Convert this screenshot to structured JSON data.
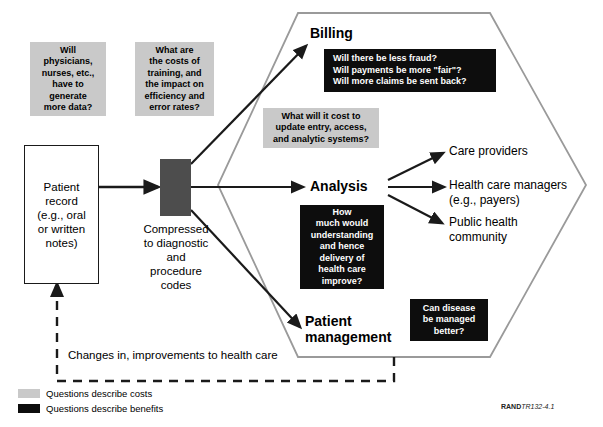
{
  "diagram": {
    "colors": {
      "cost_box_fill": "#c9c9c9",
      "benefit_box_fill": "#0d0d0d",
      "benefit_box_text": "#ffffff",
      "hexagon_stroke": "#9a9a9a",
      "arrow_stroke": "#1a1a1a",
      "compressed_fill": "#4d4d4d",
      "background": "#ffffff"
    }
  },
  "cost_questions": [
    {
      "id": "generate-more-data",
      "lines": [
        "Will",
        "physicians,",
        "nurses, etc.,",
        "have to",
        "generate",
        "more data?"
      ]
    },
    {
      "id": "training-costs",
      "lines": [
        "What are",
        "the costs of",
        "training, and",
        "the impact on",
        "efficiency and",
        "error rates?"
      ]
    },
    {
      "id": "system-update-costs",
      "lines": [
        "What will it cost to",
        "update entry, access,",
        "and analytic systems?"
      ]
    }
  ],
  "benefit_questions": [
    {
      "id": "billing-benefits",
      "lines": [
        "Will there be less fraud?",
        "Will payments be more \"fair\"?",
        "Will more claims be sent back?"
      ]
    },
    {
      "id": "analysis-benefits",
      "lines": [
        "How",
        "much would",
        "understanding",
        "and hence",
        "delivery of",
        "health care",
        "improve?"
      ]
    },
    {
      "id": "patient-management-benefits",
      "lines": [
        "Can disease",
        "be managed",
        "better?"
      ]
    }
  ],
  "input_node": {
    "id": "patient-record",
    "lines": [
      "Patient",
      "record",
      "(e.g., oral",
      "or written",
      "notes)"
    ]
  },
  "transform_node": {
    "id": "compressed-codes",
    "caption_lines": [
      "Compressed",
      "to diagnostic",
      "and",
      "procedure",
      "codes"
    ]
  },
  "stages": [
    {
      "id": "billing",
      "lines": [
        "Billing"
      ]
    },
    {
      "id": "analysis",
      "lines": [
        "Analysis"
      ]
    },
    {
      "id": "patient-management",
      "lines": [
        "Patient",
        "management"
      ]
    }
  ],
  "outcomes": [
    {
      "id": "care-providers",
      "lines": [
        "Care providers"
      ]
    },
    {
      "id": "health-care-managers",
      "lines": [
        "Health care managers",
        "(e.g., payers)"
      ]
    },
    {
      "id": "public-health-community",
      "lines": [
        "Public health",
        "community"
      ]
    }
  ],
  "feedback": {
    "id": "feedback-loop",
    "label": "Changes in, improvements to health care"
  },
  "legend": [
    {
      "id": "legend-costs",
      "swatch": "costs",
      "label": "Questions describe costs"
    },
    {
      "id": "legend-benefits",
      "swatch": "benefits",
      "label": "Questions describe benefits"
    }
  ],
  "source_note": {
    "brand": "RAND",
    "code": "TR132-4.1"
  }
}
